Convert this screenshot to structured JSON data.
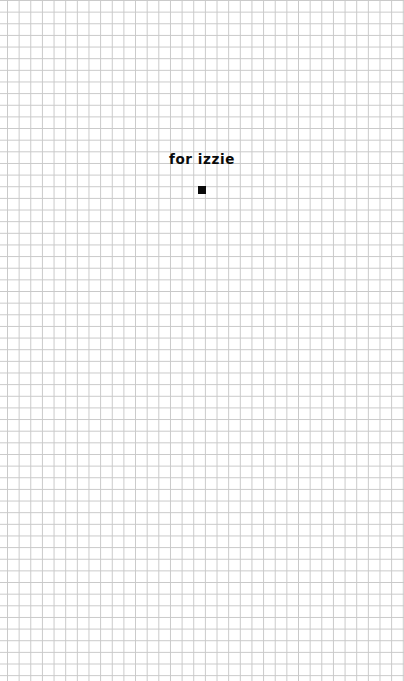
{
  "page": {
    "title": "for izzie",
    "marker_icon": "square-icon",
    "background": "graph-paper-grid",
    "colors": {
      "background": "#ffffff",
      "grid_line": "#c9c9c9",
      "text": "#0a0a0a"
    }
  }
}
